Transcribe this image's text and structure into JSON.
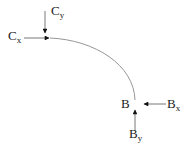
{
  "diagram": {
    "type": "free-body diagram",
    "member": "curved arc from C to B",
    "colors": {
      "stroke": "#222222",
      "arc": "#8a8a8a",
      "background": "#ffffff"
    },
    "labels": {
      "C": {
        "x": {
          "base": "C",
          "sub": "x"
        },
        "y": {
          "base": "C",
          "sub": "y"
        }
      },
      "B": {
        "point": "B",
        "x": {
          "base": "B",
          "sub": "x"
        },
        "y": {
          "base": "B",
          "sub": "y"
        }
      }
    },
    "forces": [
      {
        "name": "Cx",
        "at": "C",
        "direction": "right"
      },
      {
        "name": "Cy",
        "at": "C",
        "direction": "down"
      },
      {
        "name": "Bx",
        "at": "B",
        "direction": "left"
      },
      {
        "name": "By",
        "at": "B",
        "direction": "up"
      }
    ]
  }
}
